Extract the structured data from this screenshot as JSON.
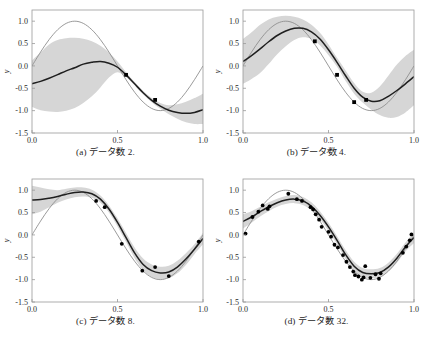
{
  "figure": {
    "type": "multi-panel-scatter-line",
    "panel_count": 4,
    "layout": "2x2",
    "background_color": "#ffffff"
  },
  "axes": {
    "xlabel": "x",
    "ylabel": "y",
    "xticks": [
      "0.0",
      "0.5",
      "1.0"
    ],
    "xtick_values": [
      0.0,
      0.5,
      1.0
    ],
    "yticks": [
      "1.0",
      "0.5",
      "0.0",
      "-0.5",
      "-1.0",
      "-1.5"
    ],
    "ytick_values": [
      1.0,
      0.5,
      0.0,
      -0.5,
      -1.0,
      -1.5
    ],
    "xlim": [
      0.0,
      1.0
    ],
    "ylim": [
      -1.5,
      1.25
    ],
    "grid": false
  },
  "style": {
    "band_color": "#d6d6d6",
    "mean_line_color": "#1f1f1f",
    "true_line_color": "#8f8f8f",
    "point_color": "#000000",
    "frame_color": "#999999"
  },
  "captions": {
    "a": "(a) データ数 2.",
    "b": "(b) データ数 4.",
    "c": "(c) データ数 8.",
    "d": "(d) データ数 32."
  },
  "chart_data": [
    {
      "id": "a",
      "type": "line",
      "title": "(a) データ数 2.",
      "xlabel": "x",
      "ylabel": "y",
      "xlim": [
        0.0,
        1.0
      ],
      "ylim": [
        -1.5,
        1.25
      ],
      "n_data": 2,
      "legend": [],
      "series": [
        {
          "name": "true function",
          "style": "thin-gray-line",
          "x": [
            0.0,
            0.05,
            0.1,
            0.15,
            0.2,
            0.25,
            0.3,
            0.35,
            0.4,
            0.45,
            0.5,
            0.55,
            0.6,
            0.65,
            0.7,
            0.75,
            0.8,
            0.85,
            0.9,
            0.95,
            1.0
          ],
          "values": [
            0.0,
            0.309,
            0.588,
            0.809,
            0.951,
            1.0,
            0.951,
            0.809,
            0.588,
            0.309,
            0.0,
            -0.309,
            -0.588,
            -0.809,
            -0.951,
            -1.0,
            -0.951,
            -0.809,
            -0.588,
            -0.309,
            0.0
          ]
        },
        {
          "name": "predictive mean",
          "style": "thick-dark-line",
          "x": [
            0.0,
            0.05,
            0.1,
            0.15,
            0.2,
            0.25,
            0.3,
            0.35,
            0.4,
            0.45,
            0.5,
            0.55,
            0.6,
            0.65,
            0.7,
            0.75,
            0.8,
            0.85,
            0.9,
            0.95,
            1.0
          ],
          "values": [
            -0.4,
            -0.345,
            -0.275,
            -0.195,
            -0.11,
            -0.04,
            0.04,
            0.08,
            0.1,
            0.06,
            -0.03,
            -0.2,
            -0.4,
            -0.6,
            -0.77,
            -0.9,
            -0.99,
            -1.04,
            -1.06,
            -1.04,
            -0.98
          ]
        },
        {
          "name": "predictive std upper",
          "style": "band-edge",
          "x": [
            0.0,
            0.05,
            0.1,
            0.15,
            0.2,
            0.25,
            0.3,
            0.35,
            0.4,
            0.45,
            0.5,
            0.55,
            0.6,
            0.65,
            0.7,
            0.75,
            0.8,
            0.85,
            0.9,
            0.95,
            1.0
          ],
          "values": [
            0.12,
            0.3,
            0.48,
            0.58,
            0.62,
            0.63,
            0.61,
            0.55,
            0.45,
            0.3,
            0.1,
            -0.14,
            -0.36,
            -0.56,
            -0.72,
            -0.83,
            -0.88,
            -0.86,
            -0.8,
            -0.72,
            -0.62
          ]
        },
        {
          "name": "predictive std lower",
          "style": "band-edge",
          "x": [
            0.0,
            0.05,
            0.1,
            0.15,
            0.2,
            0.25,
            0.3,
            0.35,
            0.4,
            0.45,
            0.5,
            0.55,
            0.6,
            0.65,
            0.7,
            0.75,
            0.8,
            0.85,
            0.9,
            0.95,
            1.0
          ],
          "values": [
            -0.92,
            -0.99,
            -1.02,
            -1.03,
            -1.0,
            -0.94,
            -0.83,
            -0.68,
            -0.48,
            -0.26,
            -0.14,
            -0.25,
            -0.44,
            -0.64,
            -0.81,
            -0.96,
            -1.08,
            -1.18,
            -1.26,
            -1.3,
            -1.3
          ]
        }
      ],
      "points": [
        {
          "x": 0.55,
          "y": -0.2
        },
        {
          "x": 0.72,
          "y": -0.76
        }
      ]
    },
    {
      "id": "b",
      "type": "line",
      "title": "(b) データ数 4.",
      "xlabel": "x",
      "ylabel": "y",
      "xlim": [
        0.0,
        1.0
      ],
      "ylim": [
        -1.5,
        1.25
      ],
      "n_data": 4,
      "legend": [],
      "series": [
        {
          "name": "true function",
          "style": "thin-gray-line",
          "x": [
            0.0,
            0.05,
            0.1,
            0.15,
            0.2,
            0.25,
            0.3,
            0.35,
            0.4,
            0.45,
            0.5,
            0.55,
            0.6,
            0.65,
            0.7,
            0.75,
            0.8,
            0.85,
            0.9,
            0.95,
            1.0
          ],
          "values": [
            0.0,
            0.309,
            0.588,
            0.809,
            0.951,
            1.0,
            0.951,
            0.809,
            0.588,
            0.309,
            0.0,
            -0.309,
            -0.588,
            -0.809,
            -0.951,
            -1.0,
            -0.951,
            -0.809,
            -0.588,
            -0.309,
            0.0
          ]
        },
        {
          "name": "predictive mean",
          "style": "thick-dark-line",
          "x": [
            0.0,
            0.05,
            0.1,
            0.15,
            0.2,
            0.25,
            0.3,
            0.35,
            0.4,
            0.45,
            0.5,
            0.55,
            0.6,
            0.65,
            0.7,
            0.75,
            0.8,
            0.85,
            0.9,
            0.95,
            1.0
          ],
          "values": [
            0.1,
            0.23,
            0.38,
            0.54,
            0.68,
            0.78,
            0.84,
            0.84,
            0.76,
            0.6,
            0.36,
            0.08,
            -0.22,
            -0.5,
            -0.7,
            -0.79,
            -0.78,
            -0.68,
            -0.55,
            -0.4,
            -0.24
          ]
        },
        {
          "name": "predictive std upper",
          "style": "band-edge",
          "x": [
            0.0,
            0.05,
            0.1,
            0.15,
            0.2,
            0.25,
            0.3,
            0.35,
            0.4,
            0.45,
            0.5,
            0.55,
            0.6,
            0.65,
            0.7,
            0.75,
            0.8,
            0.85,
            0.9,
            0.95,
            1.0
          ],
          "values": [
            0.6,
            0.75,
            0.92,
            1.04,
            1.1,
            1.12,
            1.1,
            1.04,
            0.92,
            0.74,
            0.48,
            0.18,
            -0.1,
            -0.38,
            -0.58,
            -0.6,
            -0.46,
            -0.22,
            0.03,
            0.22,
            0.36
          ]
        },
        {
          "name": "predictive std lower",
          "style": "band-edge",
          "x": [
            0.0,
            0.05,
            0.1,
            0.15,
            0.2,
            0.25,
            0.3,
            0.35,
            0.4,
            0.45,
            0.5,
            0.55,
            0.6,
            0.65,
            0.7,
            0.75,
            0.8,
            0.85,
            0.9,
            0.95,
            1.0
          ],
          "values": [
            -0.4,
            -0.29,
            -0.16,
            0.04,
            0.26,
            0.44,
            0.58,
            0.64,
            0.6,
            0.46,
            0.24,
            -0.02,
            -0.34,
            -0.62,
            -0.82,
            -0.98,
            -1.1,
            -1.16,
            -1.14,
            -1.04,
            -0.88
          ]
        }
      ],
      "points": [
        {
          "x": 0.42,
          "y": 0.55
        },
        {
          "x": 0.55,
          "y": -0.2
        },
        {
          "x": 0.65,
          "y": -0.81
        },
        {
          "x": 0.72,
          "y": -0.76
        }
      ]
    },
    {
      "id": "c",
      "type": "line",
      "title": "(c) データ数 8.",
      "xlabel": "x",
      "ylabel": "y",
      "xlim": [
        0.0,
        1.0
      ],
      "ylim": [
        -1.5,
        1.25
      ],
      "n_data": 8,
      "legend": [],
      "series": [
        {
          "name": "true function",
          "style": "thin-gray-line",
          "x": [
            0.0,
            0.05,
            0.1,
            0.15,
            0.2,
            0.25,
            0.3,
            0.35,
            0.4,
            0.45,
            0.5,
            0.55,
            0.6,
            0.65,
            0.7,
            0.75,
            0.8,
            0.85,
            0.9,
            0.95,
            1.0
          ],
          "values": [
            0.0,
            0.309,
            0.588,
            0.809,
            0.951,
            1.0,
            0.951,
            0.809,
            0.588,
            0.309,
            0.0,
            -0.309,
            -0.588,
            -0.809,
            -0.951,
            -1.0,
            -0.951,
            -0.809,
            -0.588,
            -0.309,
            0.0
          ]
        },
        {
          "name": "predictive mean",
          "style": "thick-dark-line",
          "x": [
            0.0,
            0.05,
            0.1,
            0.15,
            0.2,
            0.25,
            0.3,
            0.35,
            0.4,
            0.45,
            0.5,
            0.55,
            0.6,
            0.65,
            0.7,
            0.75,
            0.8,
            0.85,
            0.9,
            0.95,
            1.0
          ],
          "values": [
            0.78,
            0.79,
            0.82,
            0.86,
            0.91,
            0.95,
            0.96,
            0.92,
            0.8,
            0.58,
            0.28,
            -0.06,
            -0.4,
            -0.66,
            -0.8,
            -0.85,
            -0.83,
            -0.72,
            -0.54,
            -0.32,
            -0.08
          ]
        },
        {
          "name": "predictive std upper",
          "style": "band-edge",
          "x": [
            0.0,
            0.05,
            0.1,
            0.15,
            0.2,
            0.25,
            0.3,
            0.35,
            0.4,
            0.45,
            0.5,
            0.55,
            0.6,
            0.65,
            0.7,
            0.75,
            0.8,
            0.85,
            0.9,
            0.95,
            1.0
          ],
          "values": [
            1.1,
            1.06,
            1.02,
            1.0,
            1.03,
            1.06,
            1.06,
            1.01,
            0.88,
            0.66,
            0.37,
            0.04,
            -0.28,
            -0.53,
            -0.66,
            -0.71,
            -0.69,
            -0.58,
            -0.41,
            -0.21,
            0.05
          ]
        },
        {
          "name": "predictive std lower",
          "style": "band-edge",
          "x": [
            0.0,
            0.05,
            0.1,
            0.15,
            0.2,
            0.25,
            0.3,
            0.35,
            0.4,
            0.45,
            0.5,
            0.55,
            0.6,
            0.65,
            0.7,
            0.75,
            0.8,
            0.85,
            0.9,
            0.95,
            1.0
          ],
          "values": [
            0.46,
            0.52,
            0.62,
            0.72,
            0.79,
            0.84,
            0.86,
            0.83,
            0.72,
            0.5,
            0.19,
            -0.16,
            -0.52,
            -0.79,
            -0.94,
            -0.99,
            -0.97,
            -0.86,
            -0.67,
            -0.43,
            -0.21
          ]
        }
      ],
      "points": [
        {
          "x": 0.375,
          "y": 0.76
        },
        {
          "x": 0.425,
          "y": 0.62
        },
        {
          "x": 0.525,
          "y": -0.2
        },
        {
          "x": 0.645,
          "y": -0.8
        },
        {
          "x": 0.72,
          "y": -0.72
        },
        {
          "x": 0.8,
          "y": -0.92
        },
        {
          "x": 0.975,
          "y": -0.15
        }
      ]
    },
    {
      "id": "d",
      "type": "line",
      "title": "(d) データ数 32.",
      "xlabel": "x",
      "ylabel": "y",
      "xlim": [
        0.0,
        1.0
      ],
      "ylim": [
        -1.5,
        1.25
      ],
      "n_data": 32,
      "legend": [],
      "series": [
        {
          "name": "true function",
          "style": "thin-gray-line",
          "x": [
            0.0,
            0.05,
            0.1,
            0.15,
            0.2,
            0.25,
            0.3,
            0.35,
            0.4,
            0.45,
            0.5,
            0.55,
            0.6,
            0.65,
            0.7,
            0.75,
            0.8,
            0.85,
            0.9,
            0.95,
            1.0
          ],
          "values": [
            0.0,
            0.309,
            0.588,
            0.809,
            0.951,
            1.0,
            0.951,
            0.809,
            0.588,
            0.309,
            0.0,
            -0.309,
            -0.588,
            -0.809,
            -0.951,
            -1.0,
            -0.951,
            -0.809,
            -0.588,
            -0.309,
            0.0
          ]
        },
        {
          "name": "predictive mean",
          "style": "thick-dark-line",
          "x": [
            0.0,
            0.05,
            0.1,
            0.15,
            0.2,
            0.25,
            0.3,
            0.35,
            0.4,
            0.45,
            0.5,
            0.55,
            0.6,
            0.65,
            0.7,
            0.75,
            0.8,
            0.85,
            0.9,
            0.95,
            1.0
          ],
          "values": [
            0.3,
            0.4,
            0.52,
            0.63,
            0.72,
            0.78,
            0.8,
            0.76,
            0.64,
            0.44,
            0.18,
            -0.12,
            -0.44,
            -0.7,
            -0.84,
            -0.87,
            -0.84,
            -0.72,
            -0.52,
            -0.27,
            -0.06
          ]
        },
        {
          "name": "predictive std upper",
          "style": "band-edge",
          "x": [
            0.0,
            0.05,
            0.1,
            0.15,
            0.2,
            0.25,
            0.3,
            0.35,
            0.4,
            0.45,
            0.5,
            0.55,
            0.6,
            0.65,
            0.7,
            0.75,
            0.8,
            0.85,
            0.9,
            0.95,
            1.0
          ],
          "values": [
            0.46,
            0.53,
            0.63,
            0.73,
            0.81,
            0.87,
            0.89,
            0.85,
            0.73,
            0.53,
            0.27,
            -0.03,
            -0.34,
            -0.6,
            -0.74,
            -0.77,
            -0.74,
            -0.62,
            -0.42,
            -0.17,
            0.06
          ]
        },
        {
          "name": "predictive std lower",
          "style": "band-edge",
          "x": [
            0.0,
            0.05,
            0.1,
            0.15,
            0.2,
            0.25,
            0.3,
            0.35,
            0.4,
            0.45,
            0.5,
            0.55,
            0.6,
            0.65,
            0.7,
            0.75,
            0.8,
            0.85,
            0.9,
            0.95,
            1.0
          ],
          "values": [
            0.14,
            0.27,
            0.41,
            0.53,
            0.63,
            0.69,
            0.71,
            0.67,
            0.55,
            0.35,
            0.09,
            -0.21,
            -0.54,
            -0.8,
            -0.94,
            -0.97,
            -0.94,
            -0.82,
            -0.62,
            -0.37,
            -0.18
          ]
        }
      ],
      "points": [
        {
          "x": 0.015,
          "y": 0.03
        },
        {
          "x": 0.055,
          "y": 0.4
        },
        {
          "x": 0.09,
          "y": 0.52
        },
        {
          "x": 0.115,
          "y": 0.66
        },
        {
          "x": 0.145,
          "y": 0.58
        },
        {
          "x": 0.155,
          "y": 0.64
        },
        {
          "x": 0.265,
          "y": 0.92
        },
        {
          "x": 0.315,
          "y": 0.8
        },
        {
          "x": 0.345,
          "y": 0.76
        },
        {
          "x": 0.395,
          "y": 0.62
        },
        {
          "x": 0.41,
          "y": 0.57
        },
        {
          "x": 0.425,
          "y": 0.46
        },
        {
          "x": 0.445,
          "y": 0.34
        },
        {
          "x": 0.46,
          "y": 0.18
        },
        {
          "x": 0.5,
          "y": 0.07
        },
        {
          "x": 0.515,
          "y": -0.04
        },
        {
          "x": 0.535,
          "y": -0.22
        },
        {
          "x": 0.555,
          "y": -0.28
        },
        {
          "x": 0.585,
          "y": -0.45
        },
        {
          "x": 0.605,
          "y": -0.6
        },
        {
          "x": 0.625,
          "y": -0.72
        },
        {
          "x": 0.645,
          "y": -0.82
        },
        {
          "x": 0.655,
          "y": -0.9
        },
        {
          "x": 0.675,
          "y": -0.93
        },
        {
          "x": 0.695,
          "y": -1.0
        },
        {
          "x": 0.705,
          "y": -0.95
        },
        {
          "x": 0.715,
          "y": -0.7
        },
        {
          "x": 0.745,
          "y": -0.96
        },
        {
          "x": 0.775,
          "y": -0.88
        },
        {
          "x": 0.795,
          "y": -0.98
        },
        {
          "x": 0.805,
          "y": -0.86
        },
        {
          "x": 0.935,
          "y": -0.4
        },
        {
          "x": 0.955,
          "y": -0.26
        },
        {
          "x": 0.975,
          "y": -0.12
        },
        {
          "x": 0.985,
          "y": 0.01
        }
      ]
    }
  ]
}
